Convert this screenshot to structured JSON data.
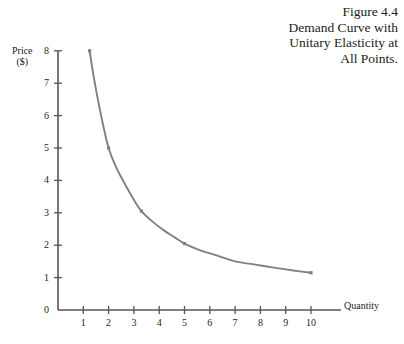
{
  "caption": {
    "figure_number": "Figure 4.4",
    "lines": [
      "Figure 4.4",
      "Demand Curve with",
      "Unitary Elasticity at",
      "All Points."
    ]
  },
  "colors": {
    "curve": "#808080",
    "axis": "#555555",
    "text": "#1c1c1c",
    "background": "#ffffff"
  },
  "chart_data": {
    "type": "line",
    "title": "Demand Curve with Unitary Elasticity at All Points.",
    "subtitle": "Figure 4.4",
    "xlabel": "Quantity",
    "ylabel": "Price ($)",
    "ylabel_lines": [
      "Price",
      "($)"
    ],
    "xlim": [
      0,
      10.6
    ],
    "ylim": [
      0,
      8
    ],
    "xticks": [
      1,
      2,
      3,
      4,
      5,
      6,
      7,
      8,
      9,
      10
    ],
    "xtick_labels": [
      "1",
      "2",
      "3",
      "4",
      "5",
      "6",
      "7",
      "8",
      "9",
      "10"
    ],
    "yticks": [
      0,
      1,
      2,
      3,
      4,
      5,
      6,
      7,
      8
    ],
    "ytick_labels": [
      "0",
      "1",
      "2",
      "3",
      "4",
      "5",
      "6",
      "7",
      "8"
    ],
    "grid": false,
    "legend": false,
    "relationship": "P * Q = 10 (constant total revenue, unitary elasticity)",
    "series": [
      {
        "name": "Demand",
        "color": "#808080",
        "marked_points": [
          {
            "x": 1.25,
            "y": 8.0
          },
          {
            "x": 2.0,
            "y": 5.0
          },
          {
            "x": 3.3,
            "y": 3.05
          },
          {
            "x": 5.0,
            "y": 2.05
          },
          {
            "x": 10.0,
            "y": 1.15
          }
        ],
        "x": [
          1.25,
          1.4,
          1.6,
          1.8,
          2.0,
          2.3,
          2.6,
          3.0,
          3.3,
          3.7,
          4.2,
          4.6,
          5.0,
          5.6,
          6.2,
          7.0,
          7.8,
          8.6,
          9.3,
          10.0
        ],
        "y": [
          8.0,
          7.25,
          6.4,
          5.65,
          5.0,
          4.4,
          3.95,
          3.4,
          3.05,
          2.75,
          2.45,
          2.25,
          2.05,
          1.85,
          1.7,
          1.5,
          1.4,
          1.3,
          1.22,
          1.15
        ]
      }
    ]
  }
}
